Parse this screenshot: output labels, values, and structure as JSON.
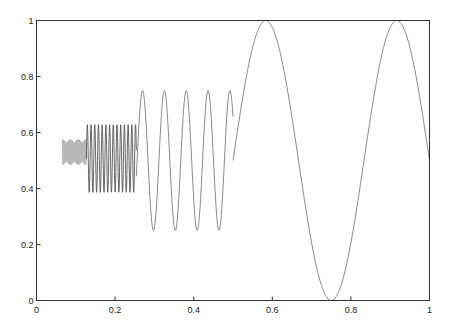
{
  "chart_data": {
    "type": "line",
    "title": "",
    "xlabel": "",
    "ylabel": "",
    "xlim": [
      0,
      1
    ],
    "ylim": [
      0,
      1
    ],
    "grid": false,
    "legend": null,
    "x_ticks": [
      0,
      0.2,
      0.4,
      0.6,
      0.8,
      1
    ],
    "x_tick_labels": [
      "0",
      "0.2",
      "0.4",
      "0.6",
      "0.8",
      "1"
    ],
    "y_ticks": [
      0,
      0.2,
      0.4,
      0.6,
      0.8,
      1
    ],
    "y_tick_labels": [
      "0",
      "0.2",
      "0.4",
      "0.6",
      "0.8",
      "1"
    ],
    "series": [
      {
        "name": "segment-1-high-freq-light",
        "description": "very high-frequency oscillation with slow amplitude modulation (grey band)",
        "x_range": [
          0.066,
          0.127
        ],
        "center": 0.53,
        "amplitude": 0.045,
        "cycles_per_unit": 600,
        "envelope_cycles_per_unit": 50,
        "color": "#b8b8b8"
      },
      {
        "name": "segment-2-dense",
        "description": "high-frequency sinusoid (dense dark band)",
        "x_range": [
          0.127,
          0.254
        ],
        "center": 0.507,
        "amplitude": 0.121,
        "cycles_per_unit": 106,
        "color": "#555555"
      },
      {
        "name": "segment-3-medium",
        "description": "medium-frequency sinusoid",
        "x_range": [
          0.254,
          0.5
        ],
        "center": 0.5,
        "amplitude": 0.25,
        "cycles_per_unit": 18,
        "peaks_x": [
          0.27,
          0.323,
          0.382,
          0.438,
          0.494
        ],
        "color": "#8a8a8a"
      },
      {
        "name": "segment-4-low",
        "description": "low-frequency sinusoid",
        "x_range": [
          0.5,
          1.0
        ],
        "center": 0.5,
        "amplitude": 0.5,
        "cycles_per_unit": 3,
        "peaks_x": [
          0.583,
          0.917
        ],
        "trough_x": [
          0.75
        ],
        "color": "#8a8a8a"
      }
    ]
  }
}
